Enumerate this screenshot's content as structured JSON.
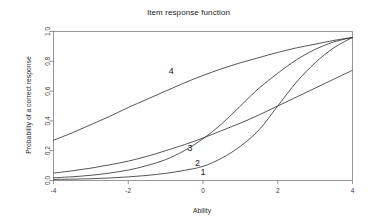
{
  "chart_data": {
    "type": "line",
    "title": "Item response function",
    "xlabel": "Ability",
    "ylabel": "Probability of a correct response",
    "xlim": [
      -4,
      4
    ],
    "ylim": [
      0,
      1
    ],
    "xticks": [
      "-4",
      "-2",
      "0",
      "2",
      "4"
    ],
    "xtick_values": [
      -4,
      -2,
      0,
      2,
      4
    ],
    "yticks": [
      "0.0",
      "0.2",
      "0.4",
      "0.6",
      "0.8",
      "1.0"
    ],
    "ytick_values": [
      0.0,
      0.2,
      0.4,
      0.6,
      0.8,
      1.0
    ],
    "grid": false,
    "legend": "inline-curve-labels",
    "line_color": "#2b2b2b",
    "frame_color": "#6b6b6b",
    "background": "#ffffff",
    "x": [
      -4,
      -3.5,
      -3,
      -2.5,
      -2,
      -1.5,
      -1,
      -0.5,
      0,
      0.5,
      1,
      1.5,
      2,
      2.5,
      3,
      3.5,
      4
    ],
    "series": [
      {
        "name": "1",
        "label": "1",
        "label_x": 0.0,
        "label_y": 0.055,
        "values": [
          0.007,
          0.009,
          0.012,
          0.017,
          0.024,
          0.034,
          0.048,
          0.068,
          0.095,
          0.15,
          0.23,
          0.34,
          0.5,
          0.66,
          0.79,
          0.89,
          0.96
        ]
      },
      {
        "name": "2",
        "label": "2",
        "label_x": -0.15,
        "label_y": 0.115,
        "values": [
          0.018,
          0.025,
          0.035,
          0.05,
          0.07,
          0.1,
          0.14,
          0.2,
          0.28,
          0.38,
          0.5,
          0.62,
          0.72,
          0.81,
          0.88,
          0.93,
          0.96
        ]
      },
      {
        "name": "3",
        "label": "3",
        "label_x": -0.35,
        "label_y": 0.215,
        "values": [
          0.05,
          0.065,
          0.083,
          0.105,
          0.13,
          0.162,
          0.2,
          0.24,
          0.285,
          0.335,
          0.385,
          0.44,
          0.5,
          0.56,
          0.62,
          0.68,
          0.74
        ]
      },
      {
        "name": "4",
        "label": "4",
        "label_x": -0.85,
        "label_y": 0.735,
        "values": [
          0.27,
          0.32,
          0.375,
          0.43,
          0.49,
          0.545,
          0.6,
          0.655,
          0.705,
          0.75,
          0.79,
          0.825,
          0.86,
          0.89,
          0.915,
          0.94,
          0.96
        ]
      }
    ]
  }
}
